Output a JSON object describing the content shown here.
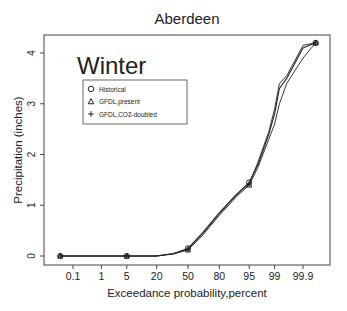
{
  "chart_data": {
    "type": "line",
    "title": "Aberdeen",
    "annotation": "Winter",
    "xlabel": "Exceedance probability,percent",
    "ylabel": "Precipitation (inches)",
    "x_scale": "normal-probability",
    "x_ticks": [
      "0.1",
      "1",
      "5",
      "20",
      "50",
      "80",
      "95",
      "99",
      "99.9"
    ],
    "y_ticks": [
      "0",
      "1",
      "2",
      "3",
      "4"
    ],
    "ylim": [
      0,
      4.3
    ],
    "grid": false,
    "legend": {
      "position": "upper-left",
      "entries": [
        {
          "marker": "circle",
          "label": "Historical"
        },
        {
          "marker": "triangle",
          "label": "GFDL,present"
        },
        {
          "marker": "plus",
          "label": "GFDL,CO2-doubled"
        }
      ]
    },
    "series": [
      {
        "name": "Historical",
        "x": [
          0.03,
          5,
          20,
          35,
          50,
          65,
          80,
          90,
          95,
          97,
          98.5,
          99,
          99.3,
          99.6,
          99.9,
          99.97
        ],
        "values": [
          0,
          0,
          0,
          0.05,
          0.15,
          0.45,
          0.85,
          1.2,
          1.45,
          1.8,
          2.4,
          2.8,
          3.3,
          3.5,
          4.1,
          4.2
        ]
      },
      {
        "name": "GFDL,present",
        "x": [
          0.03,
          5,
          20,
          35,
          50,
          65,
          80,
          90,
          95,
          97,
          98.5,
          99,
          99.3,
          99.6,
          99.9,
          99.97
        ],
        "values": [
          0,
          0,
          0,
          0.04,
          0.12,
          0.4,
          0.8,
          1.15,
          1.4,
          1.75,
          2.3,
          2.6,
          3.0,
          3.4,
          3.9,
          4.2
        ]
      },
      {
        "name": "GFDL,CO2-doubled",
        "x": [
          0.03,
          5,
          20,
          35,
          50,
          65,
          80,
          90,
          95,
          97,
          98.5,
          99,
          99.3,
          99.6,
          99.9,
          99.97
        ],
        "values": [
          0,
          0,
          0,
          0.05,
          0.14,
          0.43,
          0.83,
          1.18,
          1.42,
          1.85,
          2.45,
          2.9,
          3.4,
          3.55,
          4.15,
          4.2
        ]
      }
    ]
  }
}
